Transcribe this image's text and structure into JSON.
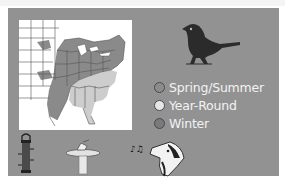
{
  "header": {
    "caption": ""
  },
  "map": {
    "title": "range-map",
    "colors": {
      "background": "#ffffff",
      "spring_summer": "#8a8a8a",
      "year_round": "#cdcdcd",
      "winter": "#6e6e6e",
      "border": "#555555"
    }
  },
  "panel": {
    "background": "#929292"
  },
  "bird": {
    "icon": "songbird-silhouette-icon",
    "color": "#2b2b2b"
  },
  "legend": {
    "items": [
      {
        "label": "Spring/Summer",
        "color": "#8c8c8c"
      },
      {
        "label": "Year-Round",
        "color": "#e6e6e6"
      },
      {
        "label": "Winter",
        "color": "#7a7a7a"
      }
    ]
  },
  "feature_icons": [
    {
      "name": "tube-feeder-icon"
    },
    {
      "name": "birdbath-icon"
    },
    {
      "name": "singing-bird-icon"
    }
  ]
}
